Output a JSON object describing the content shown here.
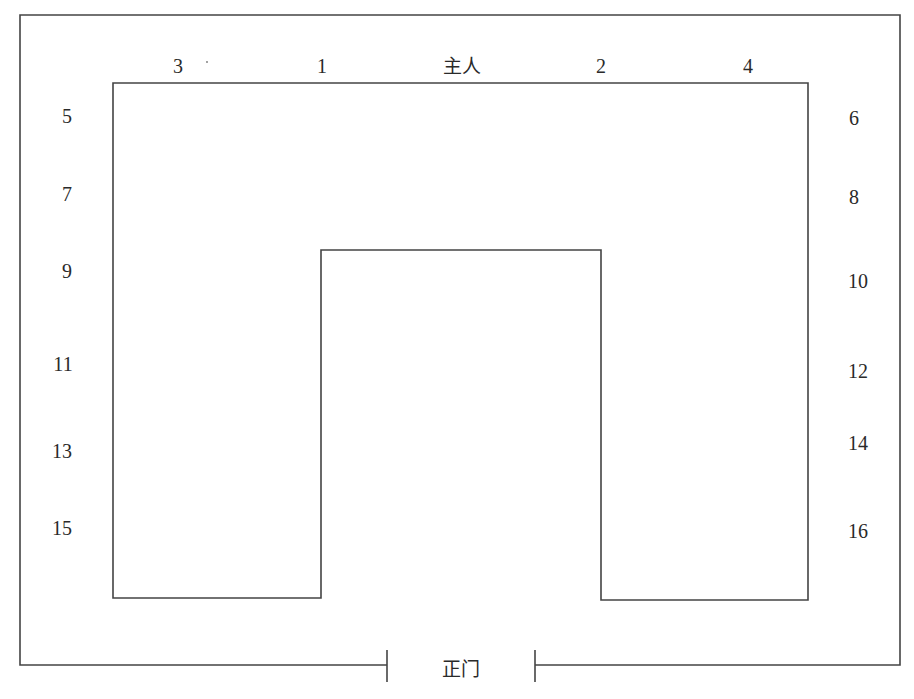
{
  "diagram": {
    "type": "seating-layout",
    "door_label": "正门",
    "host_label": "主人",
    "top_row": [
      {
        "label": "3",
        "x": 178,
        "y": 66
      },
      {
        "label": "1",
        "x": 322,
        "y": 66
      },
      {
        "label": "主人",
        "x": 462,
        "y": 66
      },
      {
        "label": "2",
        "x": 601,
        "y": 66
      },
      {
        "label": "4",
        "x": 748,
        "y": 66
      }
    ],
    "left_column": [
      {
        "label": "5",
        "x": 67,
        "y": 116
      },
      {
        "label": "7",
        "x": 67,
        "y": 194
      },
      {
        "label": "9",
        "x": 67,
        "y": 271
      },
      {
        "label": "11",
        "x": 63,
        "y": 364
      },
      {
        "label": "13",
        "x": 62,
        "y": 451
      },
      {
        "label": "15",
        "x": 62,
        "y": 528
      }
    ],
    "right_column": [
      {
        "label": "6",
        "x": 854,
        "y": 118
      },
      {
        "label": "8",
        "x": 854,
        "y": 197
      },
      {
        "label": "10",
        "x": 858,
        "y": 281
      },
      {
        "label": "12",
        "x": 858,
        "y": 371
      },
      {
        "label": "14",
        "x": 858,
        "y": 443
      },
      {
        "label": "16",
        "x": 858,
        "y": 531
      }
    ],
    "line_color": "#444444"
  }
}
